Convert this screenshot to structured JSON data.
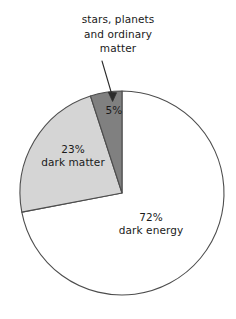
{
  "chart_data": {
    "type": "pie",
    "title": "",
    "subtitle": "",
    "xlabel": "",
    "ylabel": "",
    "legend_position": "none",
    "grid": false,
    "unit": "%",
    "start_angle_deg": 0,
    "direction": "counterclockwise",
    "categories": [
      "stars, planets and ordinary matter",
      "dark matter",
      "dark energy"
    ],
    "values": [
      5,
      23,
      72
    ],
    "slices": [
      {
        "name": "stars, planets and ordinary matter",
        "value": 5,
        "percent_label": "5%",
        "inline_label": "",
        "color": "#808080",
        "annotated": true
      },
      {
        "name": "dark matter",
        "value": 23,
        "percent_label": "23%",
        "inline_label": "dark matter",
        "color": "#d5d5d5",
        "annotated": false
      },
      {
        "name": "dark energy",
        "value": 72,
        "percent_label": "72%",
        "inline_label": "dark energy",
        "color": "#ffffff",
        "annotated": false
      }
    ],
    "annotations": [
      {
        "target_slice": "stars, planets and ordinary matter",
        "lines": [
          "stars, planets",
          "and ordinary",
          "matter"
        ],
        "text": "stars, planets and ordinary matter",
        "arrow": true
      }
    ]
  },
  "annotation": {
    "line1": "stars, planets",
    "line2": "and ordinary",
    "line3": "matter"
  },
  "labels": {
    "ordinary_pct": "5%",
    "dark_matter_pct": "23%",
    "dark_matter_name": "dark matter",
    "dark_energy_pct": "72%",
    "dark_energy_name": "dark energy"
  },
  "colors": {
    "ordinary": "#808080",
    "dark_matter": "#d5d5d5",
    "dark_energy": "#ffffff",
    "outline": "#4d4d4d",
    "text": "#1a1a1a"
  }
}
